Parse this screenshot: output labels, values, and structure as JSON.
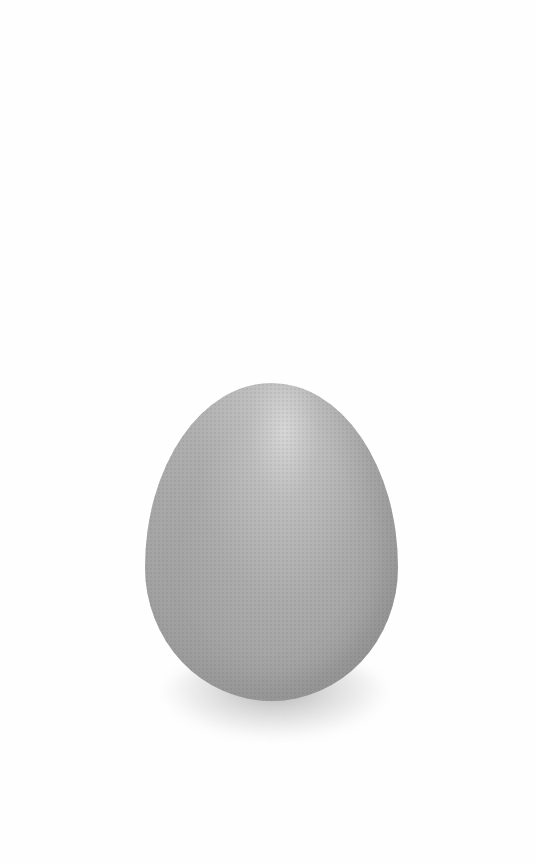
{
  "image": {
    "subject": "egg",
    "description": "A single speckled egg standing upright on a white background with a soft shadow beneath it",
    "background_color": "#fefefe",
    "egg_color": "#ababab",
    "shadow_color": "#8a8a8a"
  }
}
